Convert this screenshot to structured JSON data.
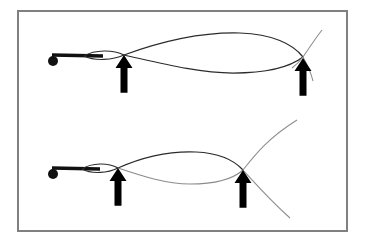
{
  "figure": {
    "canvas": {
      "width": 365,
      "height": 245,
      "background": "#ffffff"
    },
    "frame": {
      "name": "figure-border",
      "x": 17,
      "y": 10,
      "width": 331,
      "height": 222,
      "stroke": "#808080",
      "stroke_width": 2,
      "fill": "#ffffff"
    },
    "colors": {
      "ink": "#1a1a1a",
      "curve_dark": "#2b2b2b",
      "curve_light": "#8c8c8c",
      "border": "#808080",
      "background": "#ffffff"
    },
    "panels": [
      {
        "id": "panel-top",
        "label": "Top panel",
        "origin_marker": {
          "name": "origin-dot",
          "cx": 53,
          "cy": 61,
          "r": 5,
          "fill": "#111111"
        },
        "stem": {
          "name": "origin-stem",
          "x1": 52,
          "y1": 55,
          "x2": 103,
          "y2": 56,
          "stroke_width": 3.4,
          "stroke": "#111111"
        },
        "small_loop": {
          "name": "small-lens-loop",
          "start_x": 84,
          "end_x": 124,
          "top_offset": -5,
          "bottom_offset": 3,
          "stroke_width": 1.1,
          "stroke": "#2b2b2b"
        },
        "big_loop": {
          "name": "large-lens-loop",
          "start_x": 124,
          "end_x": 303,
          "peak_y": 33,
          "trough_y": 73,
          "stroke_width": 1.2,
          "stroke": "#2b2b2b"
        },
        "tail_curve": {
          "name": "tail-curve",
          "stroke_width": 1.0,
          "stroke": "#8c8c8c",
          "top_x": 322,
          "top_y": 30,
          "bottom_x": 312,
          "bottom_y": 80
        },
        "arrows": [
          {
            "name": "crossing-arrow-left",
            "tip_x": 124,
            "tip_y": 55,
            "length": 32,
            "head_width": 17,
            "head_height": 13,
            "shaft_width": 7,
            "fill": "#000000"
          },
          {
            "name": "crossing-arrow-right",
            "tip_x": 303,
            "tip_y": 58,
            "length": 32,
            "head_width": 17,
            "head_height": 13,
            "shaft_width": 7,
            "fill": "#000000"
          }
        ]
      },
      {
        "id": "panel-bottom",
        "label": "Bottom panel",
        "origin_marker": {
          "name": "origin-dot",
          "cx": 53,
          "cy": 174,
          "r": 5,
          "fill": "#111111"
        },
        "stem": {
          "name": "origin-stem",
          "x1": 52,
          "y1": 168,
          "x2": 100,
          "y2": 169,
          "stroke_width": 3.4,
          "stroke": "#111111"
        },
        "small_loop": {
          "name": "small-lens-loop",
          "start_x": 82,
          "end_x": 118,
          "top_offset": -5,
          "bottom_offset": 3,
          "stroke_width": 1.1,
          "stroke": "#2b2b2b"
        },
        "big_loop": {
          "name": "large-lens-loop",
          "start_x": 118,
          "end_x": 243,
          "peak_y": 152,
          "trough_y": 183,
          "stroke_width": 1.2,
          "stroke": "#2b2b2b"
        },
        "tail_curve": {
          "name": "tail-curve",
          "stroke_width": 1.0,
          "stroke": "#8c8c8c",
          "top_x": 297,
          "top_y": 120,
          "bottom_x": 290,
          "bottom_y": 218
        },
        "arrows": [
          {
            "name": "crossing-arrow-left",
            "tip_x": 118,
            "tip_y": 168,
            "length": 32,
            "head_width": 17,
            "head_height": 13,
            "shaft_width": 7,
            "fill": "#000000"
          },
          {
            "name": "crossing-arrow-right",
            "tip_x": 243,
            "tip_y": 170,
            "length": 32,
            "head_width": 17,
            "head_height": 13,
            "shaft_width": 7,
            "fill": "#000000"
          }
        ]
      }
    ]
  }
}
